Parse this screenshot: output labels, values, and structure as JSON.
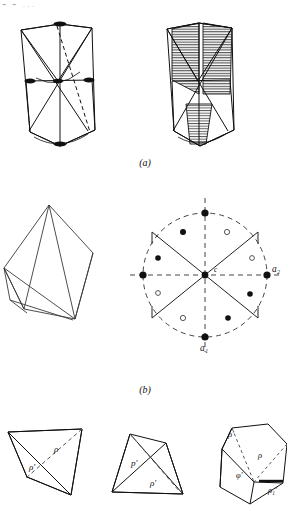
{
  "figure": {
    "title_fragment": "- - ...",
    "captions": {
      "a": "(a)",
      "b": "(b)"
    },
    "colors": {
      "ink": "#111111",
      "hatch": "#4a4a4a",
      "dashed": "#555555",
      "faint": "#8d8d8d",
      "paper": "#ffffff"
    }
  },
  "panel_a": {
    "name": "panel-a",
    "left_shape": {
      "name": "crystal-outline-left",
      "description": "tetragonal-scalenohedron outline with internal diagonals, mid horizontal edge, dashed body diagonal and dark lens markers at poles",
      "markers": [
        {
          "name": "lens-marker-top",
          "cx": 60,
          "cy": 24
        },
        {
          "name": "lens-marker-left",
          "cx": 33,
          "cy": 82
        },
        {
          "name": "lens-marker-right",
          "cx": 88,
          "cy": 80
        },
        {
          "name": "lens-marker-center",
          "cx": 58,
          "cy": 81
        },
        {
          "name": "lens-marker-bottom",
          "cx": 60,
          "cy": 131
        }
      ]
    },
    "right_shape": {
      "name": "crystal-shaded-right",
      "description": "same crystal with hatched (ruled) triangular faces indicating shading"
    }
  },
  "panel_b": {
    "name": "panel-b",
    "left_shape": {
      "name": "crystal-outline-rhombohedron",
      "description": "rhombohedral outline drawn in thin line with internal edges"
    },
    "stereogram": {
      "name": "stereographic-projection",
      "center_label": "c",
      "axis_labels": {
        "a1": "a₁",
        "a2": "a₂"
      },
      "circle": {
        "cx": 205,
        "cy": 275,
        "r": 62,
        "style": "dashed"
      },
      "axes": [
        {
          "name": "vertical-axis",
          "style": "dashed"
        },
        {
          "name": "horizontal-axis",
          "style": "dashed"
        }
      ],
      "sectors": {
        "name": "sector-lines",
        "description": "four solid lines radiating from centre to form two opposed wedges"
      },
      "poles_filled": [
        {
          "name": "pole-filled-top",
          "x": 205,
          "y": 213
        },
        {
          "name": "pole-filled-bottom",
          "x": 205,
          "y": 337
        },
        {
          "name": "pole-filled-right",
          "x": 267,
          "y": 275
        },
        {
          "name": "pole-filled-left",
          "x": 143,
          "y": 275
        },
        {
          "name": "pole-filled-upper-left",
          "x": 183,
          "y": 232
        },
        {
          "name": "pole-filled-mid-left",
          "x": 158,
          "y": 258
        },
        {
          "name": "pole-filled-lower-right",
          "x": 228,
          "y": 318
        },
        {
          "name": "pole-filled-bottom-right",
          "x": 248,
          "y": 293
        }
      ],
      "poles_open": [
        {
          "name": "pole-open-upper-right",
          "x": 227,
          "y": 232
        },
        {
          "name": "pole-open-mid-right",
          "x": 252,
          "y": 258
        },
        {
          "name": "pole-open-lower-left",
          "x": 158,
          "y": 293
        },
        {
          "name": "pole-open-bottom-left",
          "x": 183,
          "y": 318
        }
      ]
    }
  },
  "panel_c": {
    "name": "panel-c-bottom-row",
    "shapes": [
      {
        "name": "bottom-shape-left",
        "labels": [
          {
            "name": "label-rho",
            "text": "ρ",
            "x": 57,
            "y": 449
          },
          {
            "name": "label-rho-prime",
            "text": "ρ'",
            "x": 33,
            "y": 474
          }
        ]
      },
      {
        "name": "bottom-shape-middle",
        "labels": [
          {
            "name": "label-p-prime",
            "text": "p'",
            "x": 135,
            "y": 462
          },
          {
            "name": "label-rho-prime-2",
            "text": "ρ'",
            "x": 152,
            "y": 485
          }
        ]
      },
      {
        "name": "bottom-shape-right",
        "labels": [
          {
            "name": "label-rho-prime-3",
            "text": "ρ'",
            "x": 231,
            "y": 428
          },
          {
            "name": "label-rho-2",
            "text": "ρ",
            "x": 262,
            "y": 454
          },
          {
            "name": "label-phi-prime",
            "text": "φ'",
            "x": 240,
            "y": 477
          },
          {
            "name": "label-rho-1-prime",
            "text": "ρ₁'",
            "x": 273,
            "y": 489
          }
        ]
      }
    ]
  }
}
